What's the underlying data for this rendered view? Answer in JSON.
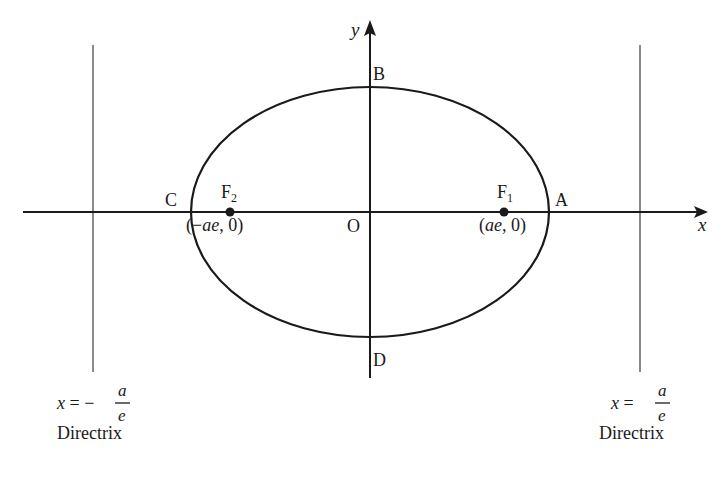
{
  "diagram": {
    "type": "ellipse-with-directrices",
    "colors": {
      "curve": "#1a1a1a",
      "axis": "#1a1a1a",
      "directrix": "#8a8a8a",
      "background": "#ffffff"
    },
    "axes": {
      "x_label": "x",
      "y_label": "y",
      "origin_label": "O"
    },
    "vertices": {
      "A": "A",
      "B": "B",
      "C": "C",
      "D": "D"
    },
    "foci": {
      "f1": {
        "name": "F",
        "sub": "1",
        "coords": "(ae, 0)",
        "coord_open": "(",
        "coord_var": "ae",
        "coord_rest": ", 0)"
      },
      "f2": {
        "name": "F",
        "sub": "2",
        "coords": "(−ae, 0)",
        "coord_open": "(−",
        "coord_var": "ae",
        "coord_rest": ", 0)"
      }
    },
    "directrices": {
      "left": {
        "lhs": "x",
        "eq": " = −",
        "num": "a",
        "den": "e",
        "caption": "Directrix"
      },
      "right": {
        "lhs": "x",
        "eq": " = ",
        "num": "a",
        "den": "e",
        "caption": "Directrix"
      }
    }
  }
}
